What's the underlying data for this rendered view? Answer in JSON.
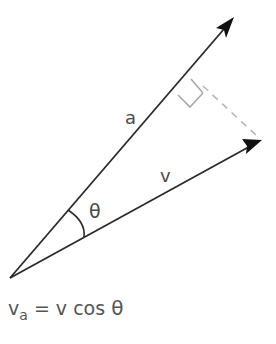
{
  "diagram": {
    "type": "vector-projection",
    "vectors": [
      {
        "name": "a",
        "label": "a",
        "from": [
          10,
          278
        ],
        "to": [
          234,
          17
        ]
      },
      {
        "name": "v",
        "label": "v",
        "from": [
          10,
          278
        ],
        "to": [
          262,
          140
        ]
      }
    ],
    "angle": {
      "label": "θ",
      "between": [
        "a",
        "v"
      ]
    },
    "projection": {
      "style": "dashed",
      "from_vector": "v",
      "onto_vector": "a",
      "right_angle_marker": true
    },
    "formula": {
      "lhs_main": "v",
      "lhs_sub": "a",
      "equals": "=",
      "rhs_text": "v cos",
      "rhs_theta": "θ"
    },
    "colors": {
      "vector_line": "#2b2b2b",
      "arrowhead": "#111111",
      "label_text": "#4a4a4a",
      "dashed_line": "#b8b8b8",
      "right_angle_marker": "#a8a8a8",
      "background": "#ffffff"
    }
  }
}
